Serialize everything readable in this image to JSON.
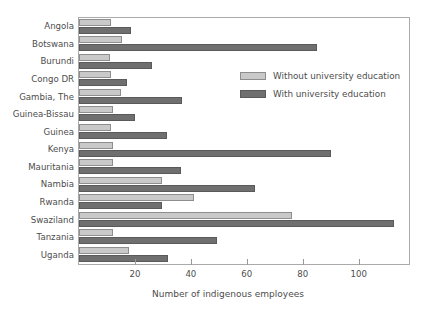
{
  "chart_data": {
    "type": "bar",
    "orientation": "horizontal",
    "title": "",
    "xlabel": "Number of indigenous employees",
    "ylabel": "",
    "xlim": [
      0,
      118
    ],
    "xticks": [
      20,
      40,
      60,
      80,
      100
    ],
    "grid": false,
    "legend_position": "upper right inside plot",
    "categories": [
      "Angola",
      "Botswana",
      "Burundi",
      "Congo DR",
      "Gambia, The",
      "Guinea-Bissau",
      "Guinea",
      "Kenya",
      "Mauritania",
      "Nambia",
      "Rwanda",
      "Swaziland",
      "Tanzania",
      "Uganda"
    ],
    "series": [
      {
        "name": "Without university education",
        "color": "#c9c9c9",
        "values": [
          11.5,
          15.5,
          11,
          11.5,
          15,
          12,
          11.5,
          12,
          12,
          29.5,
          41,
          76,
          12,
          18
        ]
      },
      {
        "name": "With university education",
        "color": "#6f6f6f",
        "values": [
          18.5,
          85,
          26,
          17,
          37,
          20,
          31.5,
          90,
          36.5,
          63,
          29.5,
          112.5,
          49.5,
          32
        ]
      }
    ]
  },
  "legend": {
    "entries": [
      {
        "label": "Without university education",
        "swatch": "light"
      },
      {
        "label": "With university education",
        "swatch": "dark"
      }
    ]
  },
  "axis": {
    "x_title": "Number of indigenous employees",
    "tick_labels": [
      "20",
      "40",
      "60",
      "80",
      "100"
    ]
  }
}
